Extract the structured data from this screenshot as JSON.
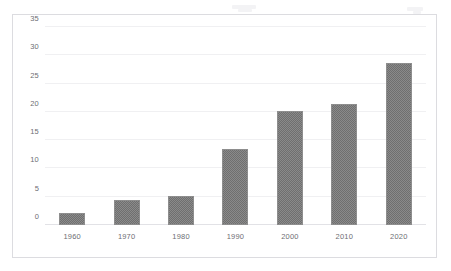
{
  "chart_data": {
    "type": "bar",
    "title": "",
    "subtitle": "",
    "xlabel": "",
    "ylabel": "",
    "categories": [
      "1960",
      "1970",
      "1980",
      "1990",
      "2000",
      "2010",
      "2020"
    ],
    "values": [
      2.1,
      4.4,
      5.1,
      13.5,
      20.2,
      21.4,
      28.7
    ],
    "ylim": [
      0,
      35
    ],
    "ytick_labels": [
      "0",
      "5",
      "10",
      "15",
      "20",
      "25",
      "30",
      "35"
    ],
    "ytick_values": [
      0,
      5,
      10,
      15,
      20,
      25,
      30,
      35
    ],
    "grid": true,
    "grid_axis": "y",
    "legend": false,
    "legend_position": "none",
    "series": [
      {
        "name": "",
        "values": [
          2.1,
          4.4,
          5.1,
          13.5,
          20.2,
          21.4,
          28.7
        ]
      }
    ],
    "annotations": []
  },
  "style": {
    "bar_color": "#7b7b7b",
    "bar_border_color": "#8e8e8e",
    "grid_color": "#f0f0f2",
    "axis_color": "#e2e2e6",
    "frame_border_color": "#dcdce0",
    "tick_label_color": "#6e6e73",
    "plot_background": "#ffffff",
    "page_background": "#ffffff"
  }
}
